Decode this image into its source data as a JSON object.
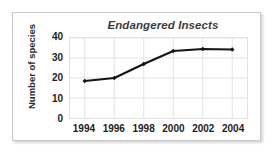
{
  "chart_data": {
    "type": "line",
    "title": "Endangered Insects",
    "xlabel": "",
    "ylabel": "Number of species",
    "x": [
      1994,
      1996,
      1998,
      2000,
      2002,
      2004
    ],
    "categories": [
      "1994",
      "1996",
      "1998",
      "2000",
      "2002",
      "2004"
    ],
    "values": [
      18.5,
      20,
      27,
      33.5,
      34.5,
      34.3
    ],
    "series": [
      {
        "name": "Number of species",
        "values": [
          18.5,
          20,
          27,
          33.5,
          34.5,
          34.3
        ]
      }
    ],
    "xlim": [
      1993,
      2005
    ],
    "ylim": [
      0,
      40
    ],
    "ytick_labels": [
      "40",
      "30",
      "20",
      "10",
      "0"
    ],
    "ytick_values": [
      40,
      30,
      20,
      10,
      0
    ],
    "xtick_labels": [
      "1994",
      "1996",
      "1998",
      "2000",
      "2002",
      "2004"
    ],
    "grid": true,
    "legend": false,
    "legend_position": "none",
    "line_color": "#151515",
    "marker": "diamond",
    "marker_color": "#151515",
    "grid_color": "#e2e2e2",
    "plot_background": "#ffffff",
    "title_color": "#3c3c3c"
  }
}
